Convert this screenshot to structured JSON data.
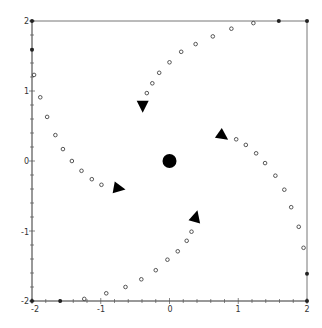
{
  "chart_data": {
    "type": "scatter",
    "title": "",
    "xlabel": "",
    "ylabel": "",
    "xlim": [
      -2,
      2
    ],
    "ylim": [
      -2,
      2
    ],
    "grid": false,
    "x_ticks": [
      -2,
      -1,
      0,
      1,
      2
    ],
    "y_ticks": [
      -2,
      -1,
      0,
      1,
      2
    ],
    "x_tick_labels": [
      "-2",
      "-1",
      "0",
      "1",
      "2"
    ],
    "y_tick_labels": [
      "-2",
      "-1",
      "0",
      "1",
      "2"
    ],
    "center_point": {
      "x": 0,
      "y": 0
    },
    "series": [
      {
        "name": "trajectory-top",
        "marker": "open-circle",
        "points": [
          [
            -0.33,
            0.97
          ],
          [
            -0.25,
            1.11
          ],
          [
            -0.15,
            1.26
          ],
          [
            0.0,
            1.41
          ],
          [
            0.17,
            1.56
          ],
          [
            0.38,
            1.67
          ],
          [
            0.63,
            1.78
          ],
          [
            0.9,
            1.89
          ],
          [
            1.22,
            1.97
          ]
        ]
      },
      {
        "name": "trajectory-right",
        "marker": "open-circle",
        "points": [
          [
            0.97,
            0.31
          ],
          [
            1.11,
            0.23
          ],
          [
            1.26,
            0.11
          ],
          [
            1.39,
            -0.03
          ],
          [
            1.54,
            -0.21
          ],
          [
            1.67,
            -0.41
          ],
          [
            1.77,
            -0.66
          ],
          [
            1.88,
            -0.94
          ],
          [
            1.95,
            -1.24
          ]
        ]
      },
      {
        "name": "trajectory-left",
        "marker": "open-circle",
        "points": [
          [
            -1.97,
            1.23
          ],
          [
            -1.88,
            0.91
          ],
          [
            -1.78,
            0.63
          ],
          [
            -1.66,
            0.37
          ],
          [
            -1.55,
            0.17
          ],
          [
            -1.42,
            0.0
          ],
          [
            -1.28,
            -0.14
          ],
          [
            -1.13,
            -0.26
          ],
          [
            -0.99,
            -0.34
          ]
        ]
      },
      {
        "name": "trajectory-bottom",
        "marker": "open-circle",
        "points": [
          [
            -1.24,
            -1.97
          ],
          [
            -0.92,
            -1.89
          ],
          [
            -0.64,
            -1.8
          ],
          [
            -0.41,
            -1.69
          ],
          [
            -0.2,
            -1.56
          ],
          [
            -0.03,
            -1.41
          ],
          [
            0.12,
            -1.29
          ],
          [
            0.25,
            -1.14
          ],
          [
            0.32,
            -1.01
          ]
        ]
      },
      {
        "name": "boundary-points",
        "marker": "filled-dot",
        "points": [
          [
            -2,
            2
          ],
          [
            -2,
            1.59
          ],
          [
            1.59,
            2
          ],
          [
            2,
            2
          ],
          [
            2,
            -1.61
          ],
          [
            2,
            -2
          ],
          [
            -2,
            -2
          ],
          [
            -1.59,
            -2
          ]
        ]
      }
    ],
    "arrows": [
      {
        "x": -0.39,
        "y": 0.79,
        "direction": "down"
      },
      {
        "x": 0.77,
        "y": 0.36,
        "direction": "down-right"
      },
      {
        "x": -0.74,
        "y": -0.39,
        "direction": "right"
      },
      {
        "x": 0.38,
        "y": -0.8,
        "direction": "up"
      }
    ]
  },
  "axis": {
    "x_labels": [
      "-2",
      "-1",
      "0",
      "1",
      "2"
    ],
    "y_labels": [
      "2",
      "1",
      "0",
      "-1",
      "-2"
    ]
  }
}
